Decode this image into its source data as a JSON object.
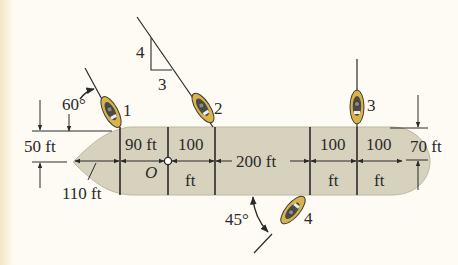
{
  "figure": {
    "ship": {
      "hull_color": "#d6d2be",
      "origin_label": "O",
      "segments": [
        {
          "id": "bow",
          "label": "110 ft"
        },
        {
          "id": "seg1",
          "label": "90 ft"
        },
        {
          "id": "seg2",
          "label_top": "100",
          "label_bottom": "ft"
        },
        {
          "id": "seg3",
          "label": "200 ft"
        },
        {
          "id": "seg4",
          "label_top": "100",
          "label_bottom": "ft"
        },
        {
          "id": "seg5",
          "label_top": "100",
          "label_bottom": "ft"
        }
      ],
      "left_offset": "50 ft",
      "right_offset": "70 ft"
    },
    "tugboats": [
      {
        "id": "1",
        "label": "1",
        "angle_label": "60°"
      },
      {
        "id": "2",
        "label": "2",
        "slope_rise": "4",
        "slope_run": "3"
      },
      {
        "id": "3",
        "label": "3"
      },
      {
        "id": "4",
        "label": "4",
        "angle_label": "45°"
      }
    ],
    "colors": {
      "background": "#fdfbf3",
      "hull": "#d6d2be",
      "boat_body": "#d9b24a",
      "boat_deck": "#4b4b45",
      "line": "#2a2a2a"
    }
  }
}
